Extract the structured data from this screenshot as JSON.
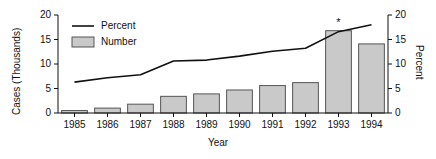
{
  "chart_data": {
    "type": "bar",
    "title": "",
    "categories": [
      "1985",
      "1986",
      "1987",
      "1988",
      "1989",
      "1990",
      "1991",
      "1992",
      "1993",
      "1994"
    ],
    "xlabel": "Year",
    "ylabel": "Cases (Thousands)",
    "y2label": "Percent",
    "ylim": [
      0,
      20
    ],
    "y2lim": [
      0,
      20
    ],
    "yticks": [
      "0",
      "5",
      "10",
      "15",
      "20"
    ],
    "y2ticks": [
      "0",
      "5",
      "10",
      "15",
      "20"
    ],
    "grid": false,
    "legend_position": "top-left",
    "series": [
      {
        "name": "Number",
        "type": "bar",
        "axis": "left",
        "unit": "Cases (Thousands)",
        "values": [
          0.5,
          1.0,
          1.8,
          3.4,
          3.9,
          4.7,
          5.6,
          6.2,
          16.8,
          14.1
        ]
      },
      {
        "name": "Percent",
        "type": "line",
        "axis": "right",
        "unit": "Percent",
        "values": [
          6.3,
          7.2,
          7.8,
          10.6,
          10.8,
          11.6,
          12.6,
          13.2,
          16.6,
          18.0
        ]
      }
    ],
    "annotations": [
      {
        "text": "*",
        "category": "1993",
        "series": "Number",
        "position": "above-bar"
      }
    ]
  },
  "legend": {
    "items": [
      {
        "label": "Percent",
        "marker": "line"
      },
      {
        "label": "Number",
        "marker": "box"
      }
    ]
  },
  "colors": {
    "bar_fill": "#c9c9c9",
    "bar_stroke": "#555555",
    "line": "#111111",
    "axis": "#111111",
    "background": "#ffffff"
  }
}
